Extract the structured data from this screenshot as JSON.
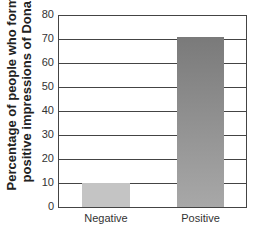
{
  "chart_data": {
    "type": "bar",
    "title": "",
    "xlabel": "",
    "ylabel": "Percentage of people who formed positive impressions of Donald",
    "ylabel_lines": [
      "Percentage of people who formed",
      "positive impressions of Donald"
    ],
    "categories": [
      "Negative",
      "Positive"
    ],
    "values": [
      10,
      71
    ],
    "ylim": [
      0,
      80
    ],
    "yticks": [
      0,
      10,
      20,
      30,
      40,
      50,
      60,
      70,
      80
    ],
    "grid": true,
    "legend": null,
    "colors": {
      "Negative": "#c4c4c4",
      "Positive": "#8a8a8a"
    }
  }
}
